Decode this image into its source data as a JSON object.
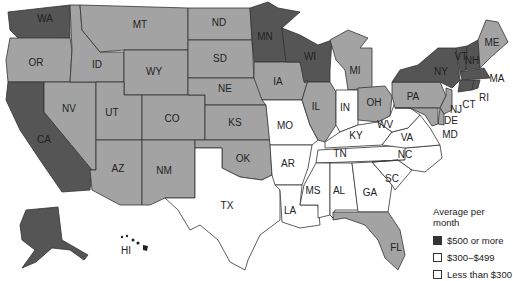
{
  "map": {
    "title": "Average per month",
    "colors": {
      "high": "#555555",
      "mid": "#a3a3a3",
      "low": "#ffffff"
    },
    "states": [
      {
        "abbr": "WA",
        "tier": "high"
      },
      {
        "abbr": "OR",
        "tier": "mid"
      },
      {
        "abbr": "CA",
        "tier": "high"
      },
      {
        "abbr": "NV",
        "tier": "mid"
      },
      {
        "abbr": "ID",
        "tier": "mid"
      },
      {
        "abbr": "MT",
        "tier": "mid"
      },
      {
        "abbr": "WY",
        "tier": "mid"
      },
      {
        "abbr": "UT",
        "tier": "mid"
      },
      {
        "abbr": "AZ",
        "tier": "mid"
      },
      {
        "abbr": "CO",
        "tier": "mid"
      },
      {
        "abbr": "NM",
        "tier": "mid"
      },
      {
        "abbr": "ND",
        "tier": "mid"
      },
      {
        "abbr": "SD",
        "tier": "mid"
      },
      {
        "abbr": "NE",
        "tier": "mid"
      },
      {
        "abbr": "KS",
        "tier": "mid"
      },
      {
        "abbr": "OK",
        "tier": "mid"
      },
      {
        "abbr": "TX",
        "tier": "low"
      },
      {
        "abbr": "MN",
        "tier": "high"
      },
      {
        "abbr": "IA",
        "tier": "mid"
      },
      {
        "abbr": "MO",
        "tier": "low"
      },
      {
        "abbr": "AR",
        "tier": "low"
      },
      {
        "abbr": "LA",
        "tier": "low"
      },
      {
        "abbr": "WI",
        "tier": "high"
      },
      {
        "abbr": "IL",
        "tier": "mid"
      },
      {
        "abbr": "MI",
        "tier": "mid"
      },
      {
        "abbr": "IN",
        "tier": "low"
      },
      {
        "abbr": "OH",
        "tier": "mid"
      },
      {
        "abbr": "KY",
        "tier": "low"
      },
      {
        "abbr": "TN",
        "tier": "low"
      },
      {
        "abbr": "MS",
        "tier": "low"
      },
      {
        "abbr": "AL",
        "tier": "low"
      },
      {
        "abbr": "GA",
        "tier": "low"
      },
      {
        "abbr": "FL",
        "tier": "mid"
      },
      {
        "abbr": "SC",
        "tier": "low"
      },
      {
        "abbr": "NC",
        "tier": "low"
      },
      {
        "abbr": "VA",
        "tier": "low"
      },
      {
        "abbr": "WV",
        "tier": "low"
      },
      {
        "abbr": "PA",
        "tier": "mid"
      },
      {
        "abbr": "NY",
        "tier": "high"
      },
      {
        "abbr": "VT",
        "tier": "high"
      },
      {
        "abbr": "NH",
        "tier": "high"
      },
      {
        "abbr": "ME",
        "tier": "mid"
      },
      {
        "abbr": "MA",
        "tier": "high"
      },
      {
        "abbr": "RI",
        "tier": "high"
      },
      {
        "abbr": "CT",
        "tier": "high"
      },
      {
        "abbr": "NJ",
        "tier": "mid"
      },
      {
        "abbr": "DE",
        "tier": "mid"
      },
      {
        "abbr": "MD",
        "tier": "mid"
      },
      {
        "abbr": "AK",
        "tier": "high"
      },
      {
        "abbr": "HI",
        "tier": "high"
      }
    ]
  },
  "labels": {
    "WA": "WA",
    "OR": "OR",
    "CA": "CA",
    "NV": "NV",
    "ID": "ID",
    "MT": "MT",
    "WY": "WY",
    "UT": "UT",
    "AZ": "AZ",
    "CO": "CO",
    "NM": "NM",
    "ND": "ND",
    "SD": "SD",
    "NE": "NE",
    "KS": "KS",
    "OK": "OK",
    "TX": "TX",
    "MN": "MN",
    "IA": "IA",
    "MO": "MO",
    "AR": "AR",
    "LA": "LA",
    "WI": "WI",
    "IL": "IL",
    "MI": "MI",
    "IN": "IN",
    "OH": "OH",
    "KY": "KY",
    "TN": "TN",
    "MS": "MS",
    "AL": "AL",
    "GA": "GA",
    "FL": "FL",
    "SC": "SC",
    "NC": "NC",
    "VA": "VA",
    "WV": "WV",
    "PA": "PA",
    "NY": "NY",
    "VT": "VT",
    "NH": "NH",
    "ME": "ME",
    "MA": "MA",
    "RI": "RI",
    "CT": "CT",
    "NJ": "NJ",
    "DE": "DE",
    "MD": "MD",
    "HI": "HI"
  },
  "legend": {
    "title": "Average per month",
    "items": [
      {
        "label": "$500 or more",
        "color": "#333333"
      },
      {
        "label": "$300–$499",
        "color": "#ffffff"
      },
      {
        "label": "Less than $300",
        "color": "#ffffff"
      }
    ]
  }
}
